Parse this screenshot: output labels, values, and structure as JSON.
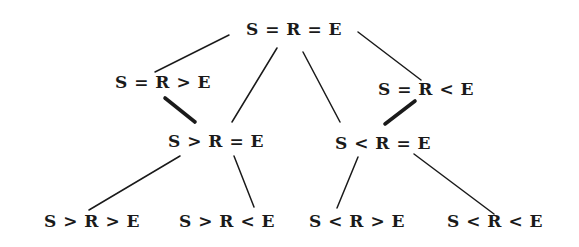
{
  "diagram": {
    "type": "lattice",
    "colors": {
      "ink": "#1a1a1a",
      "background": "#ffffff"
    },
    "nodes": [
      {
        "id": "top",
        "label": "S = R = E",
        "x": 294,
        "y": 19
      },
      {
        "id": "sreq_gt_e",
        "label": "S = R > E",
        "x": 163,
        "y": 72
      },
      {
        "id": "sreq_lt_e",
        "label": "S = R < E",
        "x": 426,
        "y": 79
      },
      {
        "id": "s_gt_req",
        "label": "S > R = E",
        "x": 216,
        "y": 131
      },
      {
        "id": "s_lt_req",
        "label": "S < R = E",
        "x": 383,
        "y": 133
      },
      {
        "id": "s_gt_r_gt_e",
        "label": "S > R > E",
        "x": 92,
        "y": 211
      },
      {
        "id": "s_gt_r_lt_e",
        "label": "S > R < E",
        "x": 227,
        "y": 211
      },
      {
        "id": "s_lt_r_gt_e",
        "label": "S < R > E",
        "x": 357,
        "y": 211
      },
      {
        "id": "s_lt_r_lt_e",
        "label": "S < R < E",
        "x": 495,
        "y": 211
      }
    ],
    "edges": [
      {
        "from": "top",
        "to": "sreq_gt_e",
        "x1": 229,
        "y1": 35,
        "x2": 155,
        "y2": 72,
        "weight": "thin"
      },
      {
        "from": "top",
        "to": "sreq_lt_e",
        "x1": 358,
        "y1": 32,
        "x2": 421,
        "y2": 80,
        "weight": "thin"
      },
      {
        "from": "top",
        "to": "s_gt_req",
        "x1": 277,
        "y1": 48,
        "x2": 232,
        "y2": 122,
        "weight": "thin"
      },
      {
        "from": "top",
        "to": "s_lt_req",
        "x1": 303,
        "y1": 52,
        "x2": 340,
        "y2": 122,
        "weight": "thin"
      },
      {
        "from": "sreq_gt_e",
        "to": "s_gt_req",
        "x1": 165,
        "y1": 98,
        "x2": 195,
        "y2": 122,
        "weight": "thick"
      },
      {
        "from": "sreq_lt_e",
        "to": "s_lt_req",
        "x1": 415,
        "y1": 101,
        "x2": 385,
        "y2": 124,
        "weight": "thick"
      },
      {
        "from": "s_gt_req",
        "to": "s_gt_r_gt_e",
        "x1": 180,
        "y1": 156,
        "x2": 89,
        "y2": 210,
        "weight": "thin"
      },
      {
        "from": "s_gt_req",
        "to": "s_gt_r_lt_e",
        "x1": 234,
        "y1": 156,
        "x2": 254,
        "y2": 207,
        "weight": "thin"
      },
      {
        "from": "s_lt_req",
        "to": "s_lt_r_gt_e",
        "x1": 358,
        "y1": 157,
        "x2": 337,
        "y2": 208,
        "weight": "thin"
      },
      {
        "from": "s_lt_req",
        "to": "s_lt_r_lt_e",
        "x1": 414,
        "y1": 154,
        "x2": 494,
        "y2": 214,
        "weight": "thin"
      }
    ]
  }
}
